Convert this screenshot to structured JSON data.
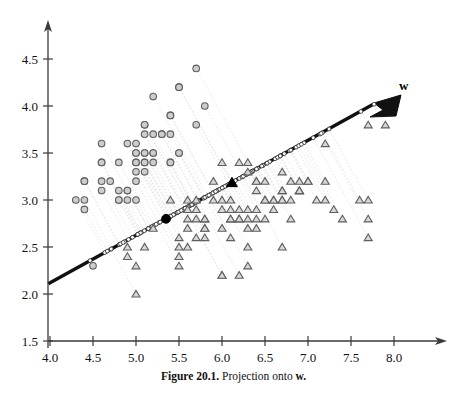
{
  "figure": {
    "caption_number": "Figure 20.1.",
    "caption_text": "Projection onto",
    "caption_symbol": "w.",
    "vector_label": "w"
  },
  "chart_data": {
    "type": "scatter",
    "title": "Figure 20.1. Projection onto w.",
    "xlabel": "",
    "ylabel": "",
    "xlim": [
      3.8,
      8.25
    ],
    "ylim": [
      1.45,
      4.75
    ],
    "xticks": [
      "4.0",
      "4.5",
      "5.0",
      "5.5",
      "6.0",
      "6.5",
      "7.0",
      "7.5",
      "8.0"
    ],
    "xtick_values": [
      4.0,
      4.5,
      5.0,
      5.5,
      6.0,
      6.5,
      7.0,
      7.5,
      8.0
    ],
    "yticks": [
      "1.5",
      "2.0",
      "2.5",
      "3.0",
      "3.5",
      "4.0",
      "4.5"
    ],
    "ytick_values": [
      1.5,
      2.0,
      2.5,
      3.0,
      3.5,
      4.0,
      4.5
    ],
    "grid": false,
    "legend": "none",
    "annotations": [
      {
        "text": "w",
        "x": 7.9,
        "y": 4.22,
        "bold": true
      }
    ],
    "projection_axis": {
      "label": "w",
      "description": "Bold black arrow (direction vector w) drawn from lower-left to upper-right with arrowhead at the tip; open small circles mark each projected data point along it.",
      "start": [
        3.98,
        2.11
      ],
      "end": [
        7.87,
        4.07
      ],
      "slope": 0.504,
      "arrowhead_at": "end"
    },
    "overlays": [
      {
        "name": "class-1-projected-mean",
        "marker": "filled-circle",
        "x": 5.35,
        "y": 2.8
      },
      {
        "name": "class-2-projected-mean",
        "marker": "filled-triangle",
        "x": 6.12,
        "y": 3.18
      }
    ],
    "series": [
      {
        "name": "class-circle",
        "marker": "circle",
        "fill": "#cdcdcd",
        "stroke": "#5f5f5f",
        "points": [
          [
            4.3,
            3.0
          ],
          [
            4.4,
            3.0
          ],
          [
            4.4,
            2.9
          ],
          [
            4.4,
            3.2
          ],
          [
            4.5,
            2.3
          ],
          [
            4.6,
            3.6
          ],
          [
            4.6,
            3.4
          ],
          [
            4.6,
            3.1
          ],
          [
            4.6,
            3.2
          ],
          [
            4.7,
            3.2
          ],
          [
            4.8,
            3.4
          ],
          [
            4.8,
            3.1
          ],
          [
            4.8,
            3.0
          ],
          [
            4.9,
            3.1
          ],
          [
            4.9,
            3.0
          ],
          [
            4.9,
            3.6
          ],
          [
            5.0,
            3.6
          ],
          [
            5.0,
            3.4
          ],
          [
            5.0,
            3.5
          ],
          [
            5.0,
            3.3
          ],
          [
            5.0,
            3.0
          ],
          [
            5.0,
            3.2
          ],
          [
            5.1,
            3.5
          ],
          [
            5.1,
            3.8
          ],
          [
            5.1,
            3.7
          ],
          [
            5.1,
            3.3
          ],
          [
            5.1,
            3.4
          ],
          [
            5.1,
            3.8
          ],
          [
            5.2,
            4.1
          ],
          [
            5.2,
            3.5
          ],
          [
            5.2,
            3.4
          ],
          [
            5.2,
            3.7
          ],
          [
            5.3,
            3.7
          ],
          [
            5.4,
            3.9
          ],
          [
            5.4,
            3.7
          ],
          [
            5.4,
            3.4
          ],
          [
            5.4,
            3.4
          ],
          [
            5.5,
            4.2
          ],
          [
            5.5,
            3.5
          ],
          [
            5.5,
            4.2
          ],
          [
            5.7,
            4.4
          ],
          [
            5.7,
            3.8
          ],
          [
            5.8,
            4.0
          ],
          [
            5.0,
            3.5
          ],
          [
            4.9,
            3.1
          ],
          [
            4.8,
            3.0
          ],
          [
            5.1,
            3.5
          ],
          [
            5.0,
            3.4
          ],
          [
            4.4,
            3.2
          ],
          [
            5.1,
            3.4
          ],
          [
            5.4,
            3.9
          ],
          [
            5.5,
            3.5
          ],
          [
            5.3,
            3.7
          ],
          [
            4.6,
            3.4
          ],
          [
            5.2,
            3.5
          ]
        ]
      },
      {
        "name": "class-triangle",
        "marker": "triangle",
        "fill": "#d8d8d8",
        "stroke": "#5f5f5f",
        "points": [
          [
            4.9,
            2.5
          ],
          [
            4.9,
            2.4
          ],
          [
            5.0,
            2.0
          ],
          [
            5.0,
            2.3
          ],
          [
            5.1,
            2.5
          ],
          [
            5.2,
            2.7
          ],
          [
            5.4,
            3.0
          ],
          [
            5.5,
            2.6
          ],
          [
            5.5,
            2.4
          ],
          [
            5.5,
            2.5
          ],
          [
            5.5,
            2.3
          ],
          [
            5.6,
            3.0
          ],
          [
            5.6,
            2.9
          ],
          [
            5.6,
            2.8
          ],
          [
            5.6,
            2.7
          ],
          [
            5.6,
            2.5
          ],
          [
            5.7,
            2.8
          ],
          [
            5.7,
            2.6
          ],
          [
            5.7,
            3.0
          ],
          [
            5.7,
            2.9
          ],
          [
            5.8,
            2.8
          ],
          [
            5.8,
            2.7
          ],
          [
            5.8,
            2.6
          ],
          [
            5.8,
            2.7
          ],
          [
            5.9,
            3.2
          ],
          [
            5.9,
            3.0
          ],
          [
            6.0,
            3.4
          ],
          [
            6.0,
            2.9
          ],
          [
            6.0,
            2.2
          ],
          [
            6.0,
            2.7
          ],
          [
            6.0,
            3.0
          ],
          [
            6.1,
            3.0
          ],
          [
            6.1,
            2.9
          ],
          [
            6.1,
            2.8
          ],
          [
            6.1,
            2.6
          ],
          [
            6.2,
            3.4
          ],
          [
            6.2,
            2.9
          ],
          [
            6.2,
            2.8
          ],
          [
            6.2,
            2.2
          ],
          [
            6.3,
            3.4
          ],
          [
            6.3,
            3.3
          ],
          [
            6.3,
            2.9
          ],
          [
            6.3,
            2.8
          ],
          [
            6.3,
            2.7
          ],
          [
            6.3,
            2.5
          ],
          [
            6.3,
            2.3
          ],
          [
            6.4,
            3.2
          ],
          [
            6.4,
            3.1
          ],
          [
            6.4,
            2.9
          ],
          [
            6.4,
            2.8
          ],
          [
            6.4,
            2.7
          ],
          [
            6.5,
            3.2
          ],
          [
            6.5,
            3.0
          ],
          [
            6.5,
            2.8
          ],
          [
            6.6,
            3.0
          ],
          [
            6.6,
            2.9
          ],
          [
            6.7,
            3.3
          ],
          [
            6.7,
            3.1
          ],
          [
            6.7,
            3.0
          ],
          [
            6.7,
            3.0
          ],
          [
            6.7,
            2.5
          ],
          [
            6.8,
            3.2
          ],
          [
            6.8,
            3.0
          ],
          [
            6.8,
            2.8
          ],
          [
            6.9,
            3.2
          ],
          [
            6.9,
            3.1
          ],
          [
            6.9,
            3.1
          ],
          [
            7.0,
            3.2
          ],
          [
            7.1,
            3.0
          ],
          [
            7.2,
            3.6
          ],
          [
            7.2,
            3.2
          ],
          [
            7.2,
            3.0
          ],
          [
            7.3,
            2.9
          ],
          [
            7.4,
            2.8
          ],
          [
            7.6,
            3.0
          ],
          [
            7.7,
            3.8
          ],
          [
            7.7,
            2.6
          ],
          [
            7.7,
            2.8
          ],
          [
            7.7,
            3.0
          ],
          [
            7.9,
            3.8
          ],
          [
            5.8,
            2.8
          ],
          [
            6.0,
            2.2
          ],
          [
            6.1,
            2.8
          ],
          [
            6.2,
            2.8
          ],
          [
            6.4,
            3.2
          ],
          [
            6.5,
            3.0
          ],
          [
            6.6,
            3.0
          ],
          [
            6.7,
            3.1
          ],
          [
            6.9,
            3.1
          ],
          [
            7.0,
            3.2
          ]
        ]
      }
    ]
  }
}
